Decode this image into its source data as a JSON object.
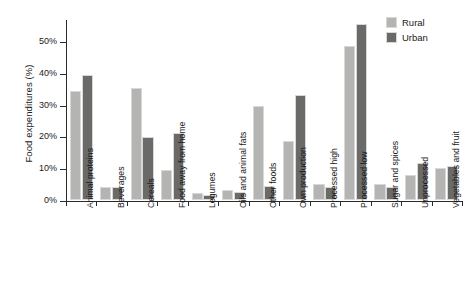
{
  "chart_data": {
    "type": "bar",
    "title": "",
    "xlabel": "",
    "ylabel": "Food expenditures (%)",
    "ylim": [
      0,
      57
    ],
    "grid": false,
    "legend_position": "top-right",
    "ytick_labels": [
      "0%",
      "10%",
      "20%",
      "30%",
      "40%",
      "50%"
    ],
    "ytick_values": [
      0,
      10,
      20,
      30,
      40,
      50
    ],
    "categories": [
      "Animal proteins",
      "Beverages",
      "Cereals",
      "Food away from home",
      "Legumes",
      "Oils and animal fats",
      "Other foods",
      "Own production",
      "Processed high",
      "Processed low",
      "Sugar and spices",
      "Unprocessed",
      "Vegetables and fruit"
    ],
    "series": [
      {
        "name": "Rural",
        "color": "#b4b4b2",
        "values": [
          34.2,
          4.0,
          35.2,
          9.5,
          2.3,
          3.2,
          29.5,
          18.7,
          4.9,
          48.5,
          5.0,
          8.0,
          10.0
        ]
      },
      {
        "name": "Urban",
        "color": "#6a6a68",
        "values": [
          39.4,
          4.0,
          19.8,
          21.2,
          1.7,
          2.5,
          4.5,
          33.0,
          4.1,
          55.4,
          4.0,
          11.5,
          10.8
        ]
      }
    ]
  }
}
